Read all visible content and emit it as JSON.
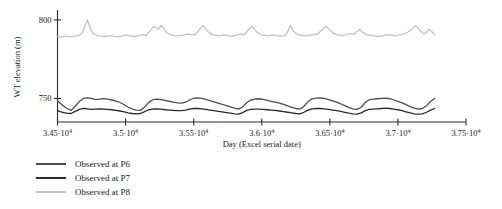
{
  "chart_data": {
    "type": "line",
    "title": "",
    "xlabel": "Day (Excel serial date)",
    "ylabel": "WT elevation (m)",
    "xlim": [
      34500,
      37500
    ],
    "ylim": [
      735,
      805
    ],
    "grid": false,
    "legend_position": "below-left",
    "xtick_values": [
      34500,
      35000,
      35500,
      36000,
      36500,
      37000,
      37500
    ],
    "xtick_labels": [
      "3.45·10",
      "3.5·10",
      "3.55·10",
      "3.6·10",
      "3.65·10",
      "3.7·10",
      "3.75·10"
    ],
    "xtick_exponent": "4",
    "ytick_values": [
      750,
      800
    ],
    "ytick_labels": [
      "750",
      "800"
    ],
    "series": [
      {
        "name": "Observed at P6",
        "color": "#4d4d4d",
        "width": 1.3,
        "x": [
          34500,
          34520,
          34545,
          34570,
          34600,
          34630,
          34660,
          34690,
          34720,
          34750,
          34780,
          34810,
          34840,
          34870,
          34900,
          34930,
          34960,
          34990,
          35020,
          35050,
          35080,
          35110,
          35140,
          35170,
          35200,
          35230,
          35260,
          35290,
          35320,
          35350,
          35380,
          35410,
          35440,
          35470,
          35500,
          35530,
          35560,
          35590,
          35620,
          35650,
          35680,
          35710,
          35740,
          35770,
          35800,
          35830,
          35860,
          35890,
          35920,
          35950,
          35980,
          36010,
          36040,
          36070,
          36100,
          36130,
          36160,
          36190,
          36220,
          36250,
          36280,
          36310,
          36340,
          36370,
          36400,
          36430,
          36460,
          36490,
          36520,
          36550,
          36580,
          36610,
          36640,
          36670,
          36700,
          36730,
          36760,
          36790,
          36820,
          36850,
          36880,
          36910,
          36940,
          36970,
          37000,
          37030,
          37060,
          37090,
          37120,
          37150,
          37180,
          37210,
          37240,
          37270
        ],
        "y": [
          748.5,
          747.0,
          745.2,
          743.6,
          742.4,
          745.0,
          748.0,
          750.0,
          750.4,
          750.0,
          749.3,
          749.6,
          749.9,
          749.5,
          749.0,
          748.3,
          747.4,
          746.0,
          744.4,
          743.2,
          742.6,
          742.4,
          744.5,
          747.5,
          749.2,
          749.6,
          749.3,
          748.7,
          748.2,
          747.7,
          747.2,
          747.0,
          747.6,
          749.0,
          750.1,
          750.4,
          750.0,
          749.4,
          748.6,
          747.8,
          747.0,
          746.2,
          745.4,
          744.6,
          743.8,
          743.2,
          744.6,
          747.4,
          749.0,
          749.6,
          749.8,
          749.4,
          748.8,
          748.2,
          747.6,
          747.0,
          746.2,
          745.2,
          744.3,
          743.6,
          743.2,
          745.0,
          748.0,
          749.7,
          750.2,
          750.4,
          750.0,
          749.2,
          748.4,
          747.6,
          746.6,
          745.4,
          744.2,
          743.4,
          743.0,
          744.4,
          747.4,
          749.2,
          749.6,
          749.8,
          750.0,
          750.2,
          749.8,
          749.0,
          748.2,
          747.2,
          746.0,
          744.8,
          743.8,
          743.2,
          743.6,
          745.4,
          748.0,
          750.0
        ]
      },
      {
        "name": "Observed at P7",
        "color": "#2a2a2a",
        "width": 1.3,
        "x": [
          34500,
          34520,
          34545,
          34570,
          34600,
          34630,
          34660,
          34690,
          34720,
          34750,
          34780,
          34810,
          34840,
          34870,
          34900,
          34930,
          34960,
          34990,
          35020,
          35050,
          35080,
          35110,
          35140,
          35170,
          35200,
          35230,
          35260,
          35290,
          35320,
          35350,
          35380,
          35410,
          35440,
          35470,
          35500,
          35530,
          35560,
          35590,
          35620,
          35650,
          35680,
          35710,
          35740,
          35770,
          35800,
          35830,
          35860,
          35890,
          35920,
          35950,
          35980,
          36010,
          36040,
          36070,
          36100,
          36130,
          36160,
          36190,
          36220,
          36250,
          36280,
          36310,
          36340,
          36370,
          36400,
          36430,
          36460,
          36490,
          36520,
          36550,
          36580,
          36610,
          36640,
          36670,
          36700,
          36730,
          36760,
          36790,
          36820,
          36850,
          36880,
          36910,
          36940,
          36970,
          37000,
          37030,
          37060,
          37090,
          37120,
          37150,
          37180,
          37210,
          37240,
          37270
        ],
        "y": [
          742.2,
          741.6,
          741.0,
          740.6,
          740.4,
          741.8,
          743.0,
          743.6,
          743.4,
          743.0,
          743.2,
          743.4,
          743.2,
          743.0,
          742.8,
          742.4,
          742.0,
          741.4,
          740.8,
          740.4,
          740.2,
          740.4,
          741.6,
          742.8,
          743.2,
          743.4,
          743.2,
          742.8,
          742.6,
          742.4,
          742.2,
          742.2,
          742.6,
          743.2,
          743.6,
          743.6,
          743.4,
          743.0,
          742.6,
          742.2,
          741.8,
          741.4,
          741.0,
          740.6,
          740.2,
          740.0,
          741.0,
          742.4,
          743.0,
          743.2,
          743.2,
          743.0,
          742.8,
          742.6,
          742.4,
          742.0,
          741.6,
          741.2,
          740.8,
          740.4,
          740.2,
          741.2,
          742.6,
          743.4,
          743.6,
          743.6,
          743.4,
          743.0,
          742.6,
          742.2,
          741.8,
          741.2,
          740.6,
          740.2,
          740.0,
          740.8,
          742.2,
          743.0,
          743.2,
          743.4,
          743.6,
          743.8,
          743.6,
          743.2,
          742.8,
          742.2,
          741.4,
          740.8,
          740.2,
          740.0,
          740.2,
          741.2,
          742.6,
          743.6
        ]
      },
      {
        "name": "Observed at P8",
        "color": "#c2c2c2",
        "width": 1.3,
        "x": [
          34500,
          34530,
          34560,
          34590,
          34620,
          34650,
          34680,
          34700,
          34720,
          34740,
          34760,
          34790,
          34820,
          34850,
          34880,
          34910,
          34940,
          34970,
          35000,
          35030,
          35060,
          35090,
          35120,
          35150,
          35180,
          35210,
          35240,
          35260,
          35280,
          35300,
          35330,
          35360,
          35390,
          35420,
          35450,
          35480,
          35510,
          35540,
          35570,
          35600,
          35620,
          35640,
          35660,
          35690,
          35720,
          35750,
          35780,
          35810,
          35840,
          35870,
          35900,
          35930,
          35960,
          35990,
          36020,
          36050,
          36080,
          36110,
          36140,
          36170,
          36190,
          36210,
          36230,
          36260,
          36290,
          36320,
          36350,
          36380,
          36410,
          36440,
          36470,
          36500,
          36530,
          36560,
          36590,
          36620,
          36650,
          36680,
          36700,
          36720,
          36740,
          36770,
          36800,
          36830,
          36860,
          36890,
          36920,
          36950,
          36980,
          37010,
          37040,
          37070,
          37100,
          37130,
          37160,
          37190,
          37210,
          37230,
          37250,
          37270
        ],
        "y": [
          789.5,
          789.0,
          789.8,
          789.2,
          789.6,
          790.0,
          791.5,
          795.5,
          800.0,
          795.0,
          791.5,
          790.2,
          789.6,
          789.4,
          790.0,
          789.6,
          789.2,
          789.6,
          790.4,
          789.8,
          789.4,
          789.8,
          790.6,
          790.2,
          793.0,
          796.0,
          794.0,
          796.5,
          794.5,
          792.0,
          790.5,
          790.0,
          789.8,
          790.2,
          791.0,
          790.6,
          790.4,
          793.5,
          796.5,
          793.0,
          791.4,
          790.6,
          790.2,
          789.8,
          790.4,
          790.0,
          789.6,
          790.2,
          791.0,
          790.4,
          793.5,
          796.0,
          792.5,
          790.8,
          790.2,
          789.8,
          790.4,
          790.0,
          789.6,
          790.0,
          792.5,
          796.5,
          793.0,
          790.8,
          790.2,
          789.8,
          790.2,
          790.6,
          791.0,
          793.5,
          796.0,
          793.5,
          791.2,
          790.4,
          790.0,
          790.6,
          791.2,
          790.8,
          792.5,
          794.0,
          792.0,
          790.6,
          790.2,
          789.8,
          789.4,
          790.0,
          790.6,
          790.2,
          789.8,
          790.4,
          791.0,
          792.0,
          794.0,
          796.5,
          793.5,
          791.0,
          792.0,
          794.0,
          792.5,
          790.5
        ]
      }
    ]
  },
  "legend": {
    "items": [
      {
        "label": "Observed at P6",
        "color": "#4d4d4d"
      },
      {
        "label": "Observed at P7",
        "color": "#2a2a2a"
      },
      {
        "label": "Observed at P8",
        "color": "#c2c2c2"
      }
    ]
  }
}
